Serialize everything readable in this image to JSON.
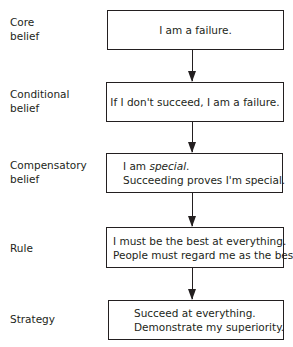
{
  "diagram": {
    "levels": [
      {
        "label_lines": [
          "Core",
          "belief"
        ],
        "box_lines": [
          "I am a failure."
        ]
      },
      {
        "label_lines": [
          "Conditional",
          "belief"
        ],
        "box_lines": [
          "If I don't succeed, I am a failure."
        ]
      },
      {
        "label_lines": [
          "Compensatory",
          "belief"
        ],
        "box_lines_prefix": "I am ",
        "box_lines_emph": "special",
        "box_lines_suffix": ".",
        "box_line2": "Succeeding proves I'm special."
      },
      {
        "label_lines": [
          "Rule"
        ],
        "box_lines": [
          "I must be the best at everything.",
          "People must regard me as the best."
        ]
      },
      {
        "label_lines": [
          "Strategy"
        ],
        "box_lines": [
          "Succeed at everything.",
          "Demonstrate my superiority."
        ]
      }
    ],
    "arrows": [
      {
        "from": "Core belief",
        "to": "Conditional belief"
      },
      {
        "from": "Conditional belief",
        "to": "Compensatory belief"
      },
      {
        "from": "Compensatory belief",
        "to": "Rule"
      },
      {
        "from": "Rule",
        "to": "Strategy"
      }
    ],
    "colors": {
      "stroke": "#231f20",
      "background": "#ffffff",
      "text": "#231f20"
    }
  }
}
